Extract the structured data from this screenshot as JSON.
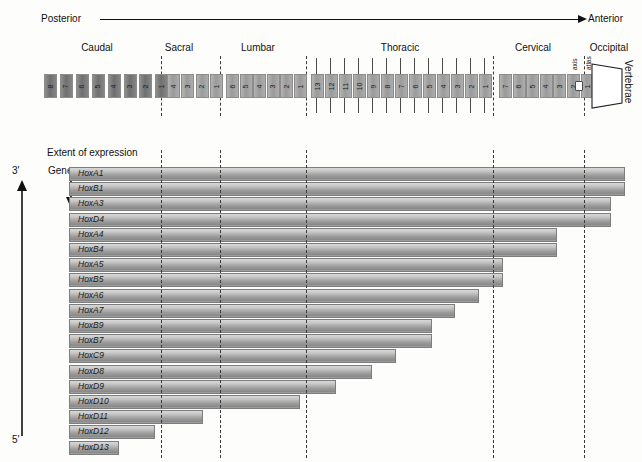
{
  "axis": {
    "left_label": "Posterior",
    "right_label": "Anterior",
    "arrow_direction": "right"
  },
  "regions": [
    {
      "name": "Caudal",
      "title": "Caudal"
    },
    {
      "name": "Sacral",
      "title": "Sacral"
    },
    {
      "name": "Lumbar",
      "title": "Lumbar"
    },
    {
      "name": "Thoracic",
      "title": "Thoracic"
    },
    {
      "name": "Cervical",
      "title": "Cervical"
    },
    {
      "name": "Occipital",
      "title": "Occipital"
    }
  ],
  "vertebrae": {
    "caudal": [
      "8",
      "7",
      "6",
      "5",
      "4",
      "3",
      "2",
      "1"
    ],
    "sacral": [
      "4",
      "3",
      "2",
      "1"
    ],
    "lumbar": [
      "6",
      "5",
      "4",
      "3",
      "2",
      "1"
    ],
    "thoracic": [
      "13",
      "12",
      "11",
      "10",
      "9",
      "8",
      "7",
      "6",
      "5",
      "4",
      "3",
      "2",
      "1"
    ],
    "cervical": [
      "7",
      "6",
      "5",
      "4",
      "3",
      "2",
      "1"
    ],
    "cervical_named": [
      {
        "number": "2",
        "name": "axis"
      },
      {
        "number": "1",
        "name": "atlas"
      }
    ],
    "occipital_label": "Vertebrae"
  },
  "chart_labels": {
    "extent": "Extent of expression",
    "genes": "Genes",
    "three_prime": "3'",
    "five_prime": "5'"
  },
  "chart_data": {
    "type": "bar",
    "title": "Extent of expression",
    "xlabel": "Vertebrae (Posterior to Anterior)",
    "ylabel": "Genes",
    "orientation": "horizontal",
    "note": "Anterior expression boundary of each Hox gene along the vertebral column. Bars extend from the posterior (left) toward their anterior limit (right). Value = anterior boundary as fraction of the plot width (0 = posterior end, 1 = anterior end).",
    "categories": [
      "HoxA1",
      "HoxB1",
      "HoxA3",
      "HoxD4",
      "HoxA4",
      "HoxB4",
      "HoxA5",
      "HoxB5",
      "HoxA6",
      "HoxA7",
      "HoxB9",
      "HoxB7",
      "HoxC9",
      "HoxD8",
      "HoxD9",
      "HoxD10",
      "HoxD11",
      "HoxD12",
      "HoxD13"
    ],
    "values": [
      1.0,
      1.0,
      0.974,
      0.974,
      0.878,
      0.878,
      0.78,
      0.78,
      0.737,
      0.694,
      0.651,
      0.651,
      0.586,
      0.543,
      0.478,
      0.413,
      0.239,
      0.152,
      0.087
    ],
    "region_boundaries": [
      {
        "label": "Caudal / Sacral",
        "x": 0.0
      },
      {
        "label": "Sacral / Lumbar",
        "x": 0.087
      },
      {
        "label": "Lumbar / Thoracic",
        "x": 0.239
      },
      {
        "label": "Thoracic / Cervical",
        "x": 0.651
      },
      {
        "label": "Cervical / Occipital",
        "x": 0.974
      }
    ],
    "grid": false,
    "legend": "none"
  },
  "colors": {
    "bar_light": "#d8d8d8",
    "bar_dark": "#8a8a8a",
    "vertebra_dark": "#7f7f7f",
    "vertebra_mid": "#a5a5a5",
    "vertebra_light": "#bcbcbc",
    "line": "#111111",
    "dashed": "#3a3a3a"
  }
}
